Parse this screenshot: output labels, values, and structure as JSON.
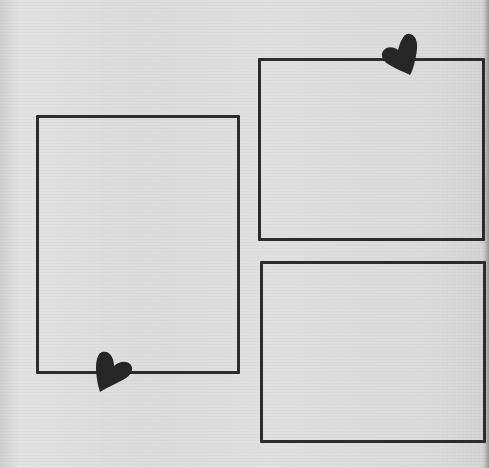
{
  "scene": {
    "description": "Hand-drawn photo frames on textured paper",
    "background_color": "#dddddd",
    "line_color": "#2c2c2c"
  },
  "frames": [
    {
      "id": "left",
      "x": 36,
      "y": 115,
      "w": 204,
      "h": 259
    },
    {
      "id": "top-right",
      "x": 258,
      "y": 58,
      "w": 227,
      "h": 183
    },
    {
      "id": "bottom-right",
      "x": 260,
      "y": 261,
      "w": 226,
      "h": 182
    }
  ],
  "hearts": [
    {
      "id": "top-right-heart",
      "x": 381,
      "y": 33
    },
    {
      "id": "left-heart",
      "x": 94,
      "y": 352
    }
  ]
}
